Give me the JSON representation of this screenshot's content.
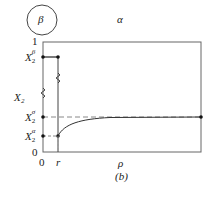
{
  "figure": {
    "panel_label": "(b)",
    "phase_circle_label": "β",
    "region_label": "α",
    "x_axis_label": "ρ",
    "y_axis_label": "X₂",
    "y_ticks": {
      "top": "1",
      "bottom": "0",
      "beta": {
        "base": "X",
        "sub": "2",
        "sup": "β"
      },
      "sigma": {
        "base": "X",
        "sub": "2",
        "sup": "σ"
      },
      "alpha": {
        "base": "X",
        "sub": "2",
        "sup": "α"
      }
    },
    "x_ticks": {
      "zero": "0",
      "r": "r"
    },
    "colors": {
      "axis": "#555555",
      "curve": "#333333",
      "dashed": "#888888"
    }
  }
}
